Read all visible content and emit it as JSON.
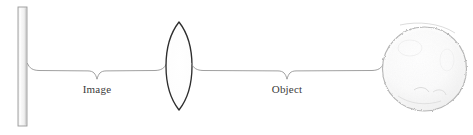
{
  "diagram": {
    "kind": "optics-ray-diagram",
    "canvas": {
      "width": 473,
      "height": 135,
      "background": "#ffffff"
    },
    "labels": {
      "image_label": "Image",
      "object_label": "Object"
    },
    "elements": {
      "screen": {
        "name": "screen",
        "shape": "vertical-bar",
        "x": 18,
        "y": 7,
        "width": 9,
        "height": 119,
        "fill": "#f4f4f4",
        "stroke": "#9a9a9a"
      },
      "lens": {
        "name": "converging-lens",
        "shape": "biconvex",
        "center_x": 179,
        "center_y": 66,
        "half_width": 13,
        "half_height": 44,
        "fill": "#fdfdfd",
        "stroke": "#2e2e2e"
      },
      "sphere": {
        "name": "object-sphere",
        "shape": "circle",
        "center_x": 424.5,
        "center_y": 69,
        "radius": 42,
        "fill": "#fafafa",
        "stroke": "#b8b8b8"
      }
    },
    "braces": {
      "image_brace": {
        "name": "image-distance-brace",
        "left_x": 27,
        "right_x": 166,
        "axis_y": 70,
        "tip_x": 97,
        "tip_y": 79,
        "stroke": "#8f8f8f"
      },
      "object_brace": {
        "name": "object-distance-brace",
        "left_x": 192,
        "right_x": 383,
        "axis_y": 70,
        "tip_x": 287,
        "tip_y": 79,
        "stroke": "#8f8f8f"
      }
    },
    "label_positions": {
      "image": {
        "x": 97,
        "y": 93
      },
      "object": {
        "x": 287,
        "y": 93
      }
    },
    "colors": {
      "line": "#8f8f8f",
      "lens_stroke": "#2e2e2e",
      "sphere_stroke": "#b8b8b8",
      "screen_stroke": "#9a9a9a",
      "text": "#3b3b3b",
      "background": "#ffffff"
    }
  }
}
